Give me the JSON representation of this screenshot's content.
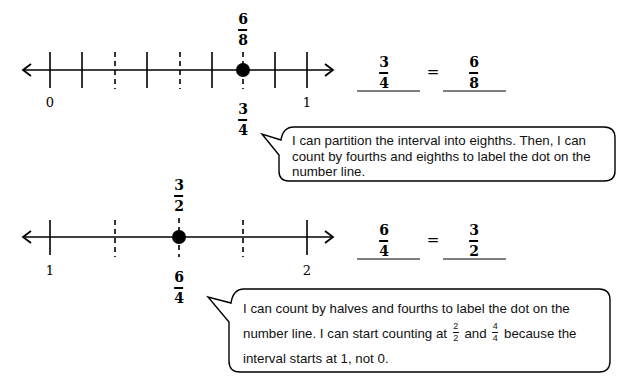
{
  "problem_a": {
    "number_line": {
      "start_label": "0",
      "end_label": "1",
      "partition": "eighths",
      "dot_position": 0.75,
      "label_above": {
        "numerator": "6",
        "denominator": "8"
      },
      "label_below": {
        "numerator": "3",
        "denominator": "4"
      }
    },
    "equation": {
      "left": {
        "numerator": "3",
        "denominator": "4"
      },
      "sign": "=",
      "right": {
        "numerator": "6",
        "denominator": "8"
      }
    },
    "speech_bubble": {
      "lines": [
        "I can partition the interval into eighths.  Then, I can",
        "count by fourths and eighths to label the dot on the",
        "number line."
      ]
    }
  },
  "problem_b": {
    "number_line": {
      "start_label": "1",
      "end_label": "2",
      "partition": "fourths",
      "dot_position": 1.5,
      "label_above": {
        "numerator": "3",
        "denominator": "2"
      },
      "label_below": {
        "numerator": "6",
        "denominator": "4"
      }
    },
    "equation": {
      "left": {
        "numerator": "6",
        "denominator": "4"
      },
      "sign": "=",
      "right": {
        "numerator": "3",
        "denominator": "2"
      }
    },
    "speech_bubble": {
      "line1": "I can count by halves and fourths to label the dot on the",
      "line2_a": "number line.  I can start counting at",
      "frac1": {
        "numerator": "2",
        "denominator": "2"
      },
      "line2_b": "and",
      "frac2": {
        "numerator": "4",
        "denominator": "4"
      },
      "line2_c": "because the",
      "line3": "interval starts at 1, not 0."
    }
  }
}
